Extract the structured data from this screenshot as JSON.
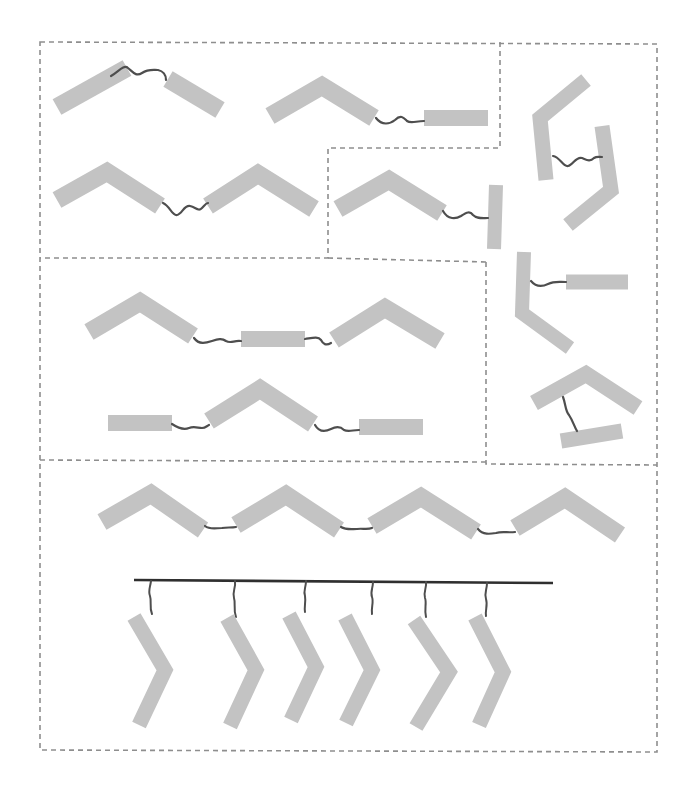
{
  "diagram": {
    "type": "molecular-assembly-schematic",
    "colors": {
      "background": "#ffffff",
      "rod": "#c3c3c3",
      "linker": "#4e4e4e",
      "surface_bar": "#2f2f2f",
      "region_border": "#8e8e8e"
    },
    "rod_width": 18,
    "regions": [
      {
        "id": "top-left",
        "label": "bent and straight rod dimers"
      },
      {
        "id": "top-middle",
        "label": "bent rod linked to perpendicular rod"
      },
      {
        "id": "right-column",
        "label": "folded / stacked dimers"
      },
      {
        "id": "middle",
        "label": "linear trimers"
      },
      {
        "id": "bottom",
        "label": "chain tetramer and surface-tethered array"
      }
    ],
    "assemblies": [
      {
        "region": "top-left",
        "description": "two straight rods joined by a wavy linker, forming an inverted V"
      },
      {
        "region": "top-left",
        "description": "bent rod linked to a horizontal straight rod"
      },
      {
        "region": "top-left",
        "description": "two bent rods joined by a linker"
      },
      {
        "region": "top-middle",
        "description": "bent rod linked to a vertical straight rod"
      },
      {
        "region": "right-column",
        "description": "two bent rods facing each other, joined by a linker"
      },
      {
        "region": "right-column",
        "description": "bent rod with horizontal straight rod attached by a linker"
      },
      {
        "region": "right-column",
        "description": "bent rod over a straight rod, joined by a vertical linker"
      },
      {
        "region": "middle",
        "description": "bent rod – straight rod – bent rod trimer"
      },
      {
        "region": "middle",
        "description": "straight rod – bent rod – straight rod trimer"
      },
      {
        "region": "bottom",
        "description": "chain of four bent rods joined by three linkers"
      },
      {
        "region": "bottom",
        "description": "six chevron-shaped rods tethered to a horizontal surface bar"
      }
    ],
    "counts": {
      "regions": 5,
      "tethered_chevrons": 6,
      "chain_units": 4
    }
  }
}
